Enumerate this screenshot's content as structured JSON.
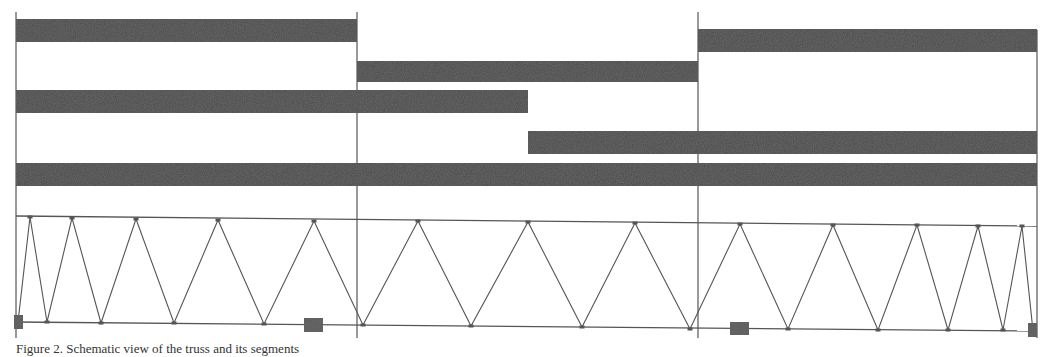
{
  "figure": {
    "caption": "Figure 2. Schematic view of the truss and its segments",
    "colors": {
      "bar": "#4a4a4a",
      "line": "#555555",
      "background": "#ffffff",
      "plate": "#555555"
    },
    "frame": {
      "left": 16,
      "right": 1037,
      "top": 12,
      "bottom": 338
    },
    "dividers": [
      357,
      698
    ],
    "bars": [
      {
        "row": 1,
        "x1": 16,
        "x2": 357,
        "y": 19,
        "h": 23
      },
      {
        "row": 2,
        "x1": 357,
        "x2": 698,
        "y": 61,
        "h": 21
      },
      {
        "row": 1,
        "x1": 698,
        "x2": 1037,
        "y": 29,
        "h": 23
      },
      {
        "row": 3,
        "x1": 16,
        "x2": 528,
        "y": 90,
        "h": 23
      },
      {
        "row": 4,
        "x1": 528,
        "x2": 1037,
        "y": 131,
        "h": 23
      },
      {
        "row": 5,
        "x1": 16,
        "x2": 1037,
        "y": 163,
        "h": 23
      }
    ],
    "truss": {
      "top_chord": {
        "x1": 16,
        "y1": 216,
        "x2": 1037,
        "y2": 226
      },
      "bottom_chord": {
        "x1": 16,
        "y1": 322,
        "x2": 1037,
        "y2": 331
      },
      "web_points": [
        [
          18,
          322
        ],
        [
          30,
          217
        ],
        [
          47,
          322
        ],
        [
          72,
          218
        ],
        [
          101,
          323
        ],
        [
          136,
          219
        ],
        [
          174,
          323
        ],
        [
          218,
          220
        ],
        [
          264,
          324
        ],
        [
          314,
          221
        ],
        [
          363,
          325
        ],
        [
          418,
          221
        ],
        [
          471,
          326
        ],
        [
          528,
          222
        ],
        [
          582,
          327
        ],
        [
          635,
          223
        ],
        [
          690,
          329
        ],
        [
          740,
          224
        ],
        [
          788,
          329
        ],
        [
          833,
          225
        ],
        [
          878,
          330
        ],
        [
          917,
          225
        ],
        [
          948,
          330
        ],
        [
          978,
          226
        ],
        [
          1003,
          330
        ],
        [
          1022,
          226
        ],
        [
          1033,
          331
        ]
      ],
      "plates": [
        {
          "x": 14,
          "y": 315,
          "w": 9,
          "h": 14
        },
        {
          "x": 304,
          "y": 318,
          "w": 19,
          "h": 14
        },
        {
          "x": 730,
          "y": 322,
          "w": 19,
          "h": 13
        },
        {
          "x": 1028,
          "y": 323,
          "w": 9,
          "h": 14
        }
      ]
    }
  }
}
